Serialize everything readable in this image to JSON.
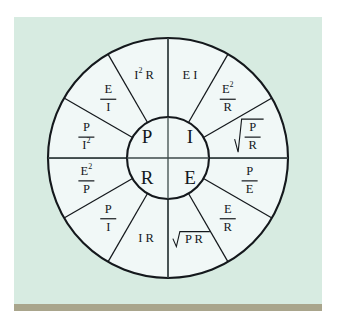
{
  "figure": {
    "name": "ohms-law-wheel",
    "background_color": "#d7ebe1",
    "wheel_fill": "#f1f8f7",
    "line_color": "#14181c",
    "bottom_bar_color": "#a9a58c"
  },
  "hub": {
    "quadrants": [
      {
        "id": "power",
        "symbol": "P",
        "position": "top-left"
      },
      {
        "id": "current",
        "symbol": "I",
        "position": "top-right"
      },
      {
        "id": "resistance",
        "symbol": "R",
        "position": "bottom-left"
      },
      {
        "id": "voltage",
        "symbol": "E",
        "position": "bottom-right"
      }
    ]
  },
  "sectors": [
    {
      "index": 0,
      "quadrant": "power",
      "type": "plain",
      "text": "E I",
      "angle_center_deg": 285
    },
    {
      "index": 1,
      "quadrant": "power",
      "type": "fraction",
      "numerator": "E",
      "numerator_sup": "2",
      "denominator": "R",
      "angle_center_deg": 315
    },
    {
      "index": 2,
      "quadrant": "current",
      "type": "radical-fraction",
      "numerator": "P",
      "denominator": "R",
      "angle_center_deg": 345
    },
    {
      "index": 3,
      "quadrant": "current",
      "type": "fraction",
      "numerator": "P",
      "denominator": "E",
      "angle_center_deg": 15
    },
    {
      "index": 4,
      "quadrant": "current",
      "type": "fraction",
      "numerator": "E",
      "denominator": "R",
      "angle_center_deg": 45
    },
    {
      "index": 5,
      "quadrant": "voltage",
      "type": "radical-plain",
      "text": "P R",
      "angle_center_deg": 75
    },
    {
      "index": 6,
      "quadrant": "voltage",
      "type": "plain",
      "text": "I R",
      "angle_center_deg": 105
    },
    {
      "index": 7,
      "quadrant": "voltage",
      "type": "fraction",
      "numerator": "P",
      "denominator": "I",
      "angle_center_deg": 135
    },
    {
      "index": 8,
      "quadrant": "resistance",
      "type": "fraction",
      "numerator": "E",
      "numerator_sup": "2",
      "denominator": "P",
      "angle_center_deg": 165
    },
    {
      "index": 9,
      "quadrant": "resistance",
      "type": "fraction",
      "numerator": "P",
      "denominator": "I",
      "denominator_sup": "2",
      "angle_center_deg": 195
    },
    {
      "index": 10,
      "quadrant": "resistance",
      "type": "fraction",
      "numerator": "E",
      "denominator": "I",
      "angle_center_deg": 225
    },
    {
      "index": 11,
      "quadrant": "power",
      "type": "plain-sup",
      "text_before": "I",
      "sup": "2",
      "text_after": "R",
      "angle_center_deg": 255
    }
  ],
  "geometry": {
    "center_x": 168,
    "center_y": 158,
    "outer_radius": 120,
    "inner_radius": 41
  }
}
